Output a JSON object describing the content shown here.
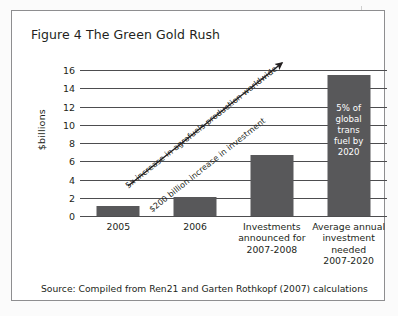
{
  "figure": {
    "title": "Figure 4 The Green Gold Rush",
    "source": "Source: Compiled from Ren21 and Garten Rothkopf (2007) calculations"
  },
  "annotations": {
    "above_arrow": "5x increase in agrofuels production worldwide",
    "below_arrow": "$200 billion increase in investment",
    "arrow_name": "growth-arrow"
  },
  "bar_callout": {
    "lines": [
      "5% of",
      "global",
      "trans",
      "fuel by",
      "2020"
    ],
    "text": "5% of global trans fuel by 2020"
  },
  "colors": {
    "bar": "#58585a",
    "gridline": "#4d4d4f",
    "frame": "#8e8e90",
    "text": "#231f20",
    "callout_text": "#ffffff"
  },
  "chart_data": {
    "type": "bar",
    "title": "Figure 4 The Green Gold Rush",
    "xlabel": "",
    "ylabel": "$billions",
    "ylim": [
      0,
      16
    ],
    "ytick_step": 2,
    "yticks": [
      16,
      14,
      12,
      10,
      8,
      6,
      4,
      2,
      0
    ],
    "ytick_labels": [
      "16",
      "14",
      "12",
      "10",
      "8",
      "6",
      "4",
      "2",
      "0"
    ],
    "grid": true,
    "legend": "none",
    "categories": [
      "2005",
      "2006",
      "Investments announced for 2007-2008",
      "Average annual investment needed 2007-2020"
    ],
    "category_lines": [
      [
        "2005"
      ],
      [
        "2006"
      ],
      [
        "Investments",
        "announced for",
        "2007-2008"
      ],
      [
        "Average annual",
        "investment",
        "needed",
        "2007-2020"
      ]
    ],
    "values": [
      1.1,
      2.1,
      6.7,
      15.5
    ],
    "annotations": [
      "5x increase in agrofuels production worldwide",
      "$200 billion increase in investment",
      "5% of global trans fuel by 2020"
    ],
    "source": "Source: Compiled from Ren21 and Garten Rothkopf (2007) calculations"
  }
}
